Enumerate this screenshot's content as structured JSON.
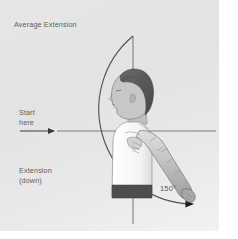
{
  "diagram": {
    "type": "range-of-motion",
    "title": "Average Extension",
    "start_label_line1": "Start",
    "start_label_line2": "here",
    "motion_label_line1": "Extension",
    "motion_label_line2": "(down)",
    "angle_label": "150°",
    "angle_value": 150,
    "moving_limb": "right arm extended downward and backward",
    "pivot": "shoulder joint",
    "colors": {
      "panel_background": "#e6e6e6",
      "axis_line": "#6e6e6e",
      "arc_line": "#4a4a4a",
      "text": "#5d5d5d",
      "skin": "#c9c9c9",
      "hair": "#565656",
      "shirt": "#fbfbfb",
      "waistband": "#4a4a4a"
    },
    "elements": {
      "vertical_axis": "vertical reference line through head and torso",
      "horizontal_axis": "horizontal reference line at shoulder height",
      "arc": "quarter-plus arc sweeping from vertical top to arm hand position",
      "start_arrow": "arrow pointing right toward axis origin",
      "arc_arrow": "arrowhead at hand end of arc"
    }
  }
}
